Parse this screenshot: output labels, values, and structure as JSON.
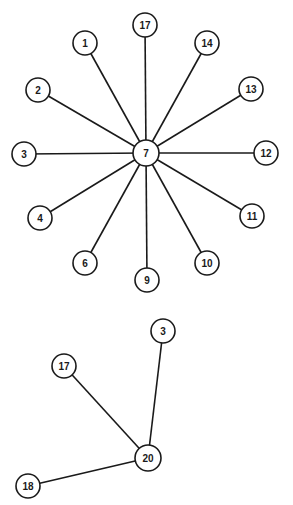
{
  "style": {
    "stroke": "#1a1a1a",
    "fill": "#ffffff",
    "background": "#ffffff"
  },
  "graphs": [
    {
      "name": "star-graph-7",
      "center": "7",
      "nodes": [
        {
          "id": "7",
          "label": "7",
          "x": 146,
          "y": 153,
          "r": 13
        },
        {
          "id": "17",
          "label": "17",
          "x": 145,
          "y": 25,
          "r": 12
        },
        {
          "id": "1",
          "label": "1",
          "x": 85,
          "y": 43,
          "r": 12
        },
        {
          "id": "14",
          "label": "14",
          "x": 207,
          "y": 43,
          "r": 12
        },
        {
          "id": "2",
          "label": "2",
          "x": 38,
          "y": 90,
          "r": 12
        },
        {
          "id": "13",
          "label": "13",
          "x": 251,
          "y": 89,
          "r": 12
        },
        {
          "id": "3",
          "label": "3",
          "x": 24,
          "y": 154,
          "r": 12
        },
        {
          "id": "12",
          "label": "12",
          "x": 266,
          "y": 153,
          "r": 12
        },
        {
          "id": "4",
          "label": "4",
          "x": 40,
          "y": 218,
          "r": 12
        },
        {
          "id": "11",
          "label": "11",
          "x": 252,
          "y": 216,
          "r": 12
        },
        {
          "id": "6",
          "label": "6",
          "x": 85,
          "y": 263,
          "r": 12
        },
        {
          "id": "10",
          "label": "10",
          "x": 207,
          "y": 263,
          "r": 12
        },
        {
          "id": "9",
          "label": "9",
          "x": 147,
          "y": 280,
          "r": 12
        }
      ],
      "edges": [
        [
          "7",
          "17"
        ],
        [
          "7",
          "1"
        ],
        [
          "7",
          "14"
        ],
        [
          "7",
          "2"
        ],
        [
          "7",
          "13"
        ],
        [
          "7",
          "3"
        ],
        [
          "7",
          "12"
        ],
        [
          "7",
          "4"
        ],
        [
          "7",
          "11"
        ],
        [
          "7",
          "6"
        ],
        [
          "7",
          "10"
        ],
        [
          "7",
          "9"
        ]
      ]
    },
    {
      "name": "star-graph-20",
      "center": "20",
      "nodes": [
        {
          "id": "20",
          "label": "20",
          "x": 148,
          "y": 458,
          "r": 13
        },
        {
          "id": "3",
          "label": "3",
          "x": 163,
          "y": 331,
          "r": 12
        },
        {
          "id": "17",
          "label": "17",
          "x": 64,
          "y": 366,
          "r": 12
        },
        {
          "id": "18",
          "label": "18",
          "x": 28,
          "y": 486,
          "r": 12
        }
      ],
      "edges": [
        [
          "20",
          "3"
        ],
        [
          "20",
          "17"
        ],
        [
          "20",
          "18"
        ]
      ]
    }
  ]
}
